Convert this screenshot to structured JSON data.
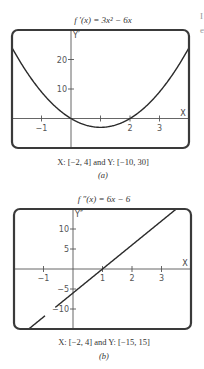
{
  "chart_data": [
    {
      "type": "line",
      "panel_label": "(a)",
      "title": "f ′(x) = 3x² − 6x",
      "function": "3x^2 - 6x",
      "caption": "X: [−2, 4] and Y: [−10, 30]",
      "xlabel": "X",
      "ylabel": "Y′",
      "xlim": [
        -2,
        4
      ],
      "ylim": [
        -10,
        30
      ],
      "x_ticks": [
        -1,
        1,
        2,
        3
      ],
      "x_tick_labels": [
        "−1",
        "",
        "2",
        "3"
      ],
      "y_ticks": [
        10,
        20
      ],
      "y_tick_labels": [
        "10",
        "20"
      ],
      "grid": false,
      "series": [
        {
          "name": "f'(x)",
          "x": [
            -2,
            -1.5,
            -1,
            -0.5,
            0,
            0.5,
            1,
            1.5,
            2,
            2.5,
            3,
            3.5,
            4
          ],
          "values": [
            24,
            15.75,
            9,
            3.75,
            0,
            -2.25,
            -3,
            -2.25,
            0,
            3.75,
            9,
            15.75,
            24
          ]
        }
      ]
    },
    {
      "type": "line",
      "panel_label": "(b)",
      "title": "f ″(x) = 6x − 6",
      "function": "6x - 6",
      "caption": "X: [−2, 4] and Y: [−15, 15]",
      "xlabel": "X",
      "ylabel": "Y″",
      "xlim": [
        -2,
        4
      ],
      "ylim": [
        -15,
        15
      ],
      "x_ticks": [
        -1,
        1,
        2,
        3
      ],
      "x_tick_labels": [
        "−1",
        "1",
        "2",
        "3"
      ],
      "y_ticks": [
        -10,
        -5,
        5,
        10
      ],
      "y_tick_labels": [
        "−10",
        "−5",
        "5",
        "10"
      ],
      "grid": false,
      "series": [
        {
          "name": "f''(x)",
          "x": [
            -2,
            -1,
            0,
            1,
            2,
            3,
            4
          ],
          "values": [
            -18,
            -12,
            -6,
            0,
            6,
            12,
            18
          ]
        }
      ]
    }
  ],
  "edge_text": [
    "I",
    "e"
  ]
}
